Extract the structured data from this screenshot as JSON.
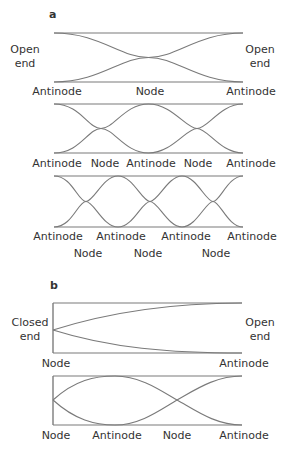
{
  "panels": {
    "a": {
      "label": "a",
      "open_end_left": [
        "Open",
        "end"
      ],
      "open_end_right": [
        "Open",
        "end"
      ],
      "diagram1": {
        "labels": [
          "Antinode",
          "Node",
          "Antinode"
        ]
      },
      "diagram2": {
        "labels": [
          "Antinode",
          "Node",
          "Antinode",
          "Node",
          "Antinode"
        ]
      },
      "diagram3": {
        "antinode_labels": [
          "Antinode",
          "Antinode",
          "Antinode",
          "Antinode"
        ],
        "node_labels": [
          "Node",
          "Node",
          "Node"
        ]
      }
    },
    "b": {
      "label": "b",
      "closed_end_left": [
        "Closed",
        "end"
      ],
      "open_end_right": [
        "Open",
        "end"
      ],
      "diagram1": {
        "labels": [
          "Node",
          "Antinode"
        ]
      },
      "diagram2": {
        "labels": [
          "Node",
          "Antinode",
          "Node",
          "Antinode"
        ]
      }
    }
  },
  "colors": {
    "wave_line": "#7a7a7a",
    "text": "#333333"
  }
}
